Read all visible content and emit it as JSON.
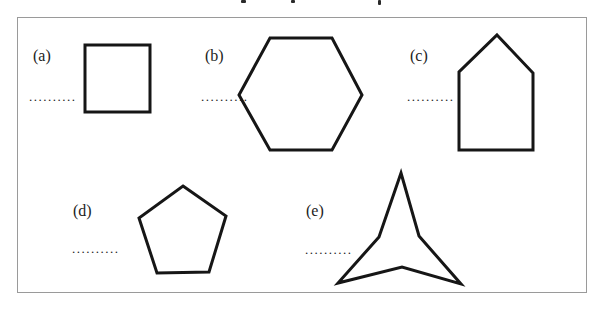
{
  "figure": {
    "description_colors": {
      "shape_stroke": "#161616",
      "frame_border": "#9a9a9a",
      "background": "#ffffff",
      "text": "#1c1c1c"
    },
    "shapes": [
      {
        "label": "(a)",
        "name": "square",
        "blank": "..........",
        "points": "85,45 150,45 150,112 85,112"
      },
      {
        "label": "(b)",
        "name": "hexagon",
        "blank": "..........",
        "points": "270,38 332,38 362,95 332,150 270,150 239,95"
      },
      {
        "label": "(c)",
        "name": "pentagon-house",
        "blank": "..........",
        "points": "497,35 533,73 533,150 459,150 459,72"
      },
      {
        "label": "(d)",
        "name": "pentagon",
        "blank": "..........",
        "points": "183,186 226,216 209,272 157,273 139,218"
      },
      {
        "label": "(e)",
        "name": "three-pointed-star",
        "blank": "..........",
        "points": "401,173 419,236 461,284 402,267 338,283 379,237"
      }
    ]
  }
}
